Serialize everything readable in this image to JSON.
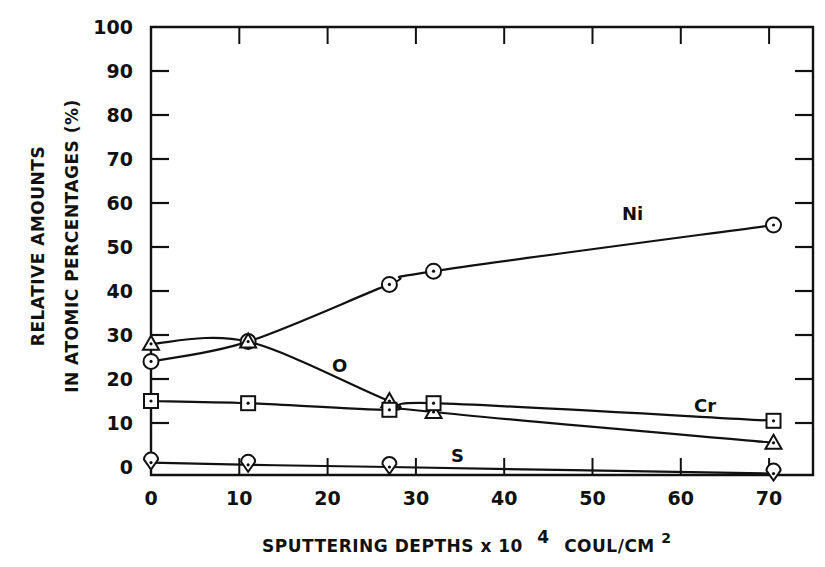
{
  "chart_data": {
    "type": "line",
    "title": "",
    "xlabel": "SPUTTERING DEPTHS x 10 4 COUL/CM2",
    "xlabel_parts": {
      "main": "SPUTTERING DEPTHS x 10",
      "exp1": "4",
      "unit": "COUL/CM",
      "exp2": "2"
    },
    "ylabel": "RELATIVE AMOUNTS IN ATOMIC PERCENTAGES (%)",
    "ylabel_lines": [
      "RELATIVE AMOUNTS",
      "IN ATOMIC PERCENTAGES (%)"
    ],
    "xlim": [
      0,
      75
    ],
    "ylim": [
      0,
      100
    ],
    "x_ticks": [
      0,
      10,
      20,
      30,
      40,
      50,
      60,
      70
    ],
    "y_ticks": [
      0,
      10,
      20,
      30,
      40,
      50,
      60,
      70,
      80,
      90,
      100
    ],
    "grid": false,
    "legend": "inline labels",
    "series": [
      {
        "name": "Ni",
        "marker": "circle",
        "x": [
          0,
          11,
          27,
          32,
          70.5
        ],
        "values": [
          24,
          28.5,
          41.5,
          44.5,
          55
        ]
      },
      {
        "name": "O",
        "marker": "triangle",
        "x": [
          0,
          11,
          27,
          32,
          70.5
        ],
        "values": [
          28,
          28.5,
          15,
          12.5,
          5.5
        ]
      },
      {
        "name": "Cr",
        "marker": "square",
        "x": [
          0,
          11,
          27,
          32,
          70.5
        ],
        "values": [
          15,
          14.5,
          13,
          14.5,
          10.5
        ]
      },
      {
        "name": "S",
        "marker": "diamond",
        "x": [
          0,
          11,
          27,
          70.5
        ],
        "values": [
          1,
          0.5,
          0,
          -1.5
        ]
      }
    ]
  }
}
